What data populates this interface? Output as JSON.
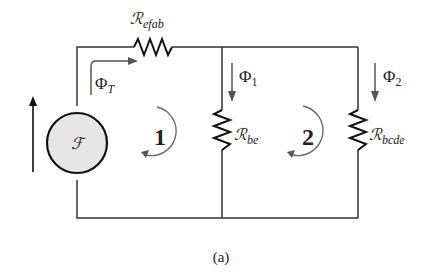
{
  "diagram": {
    "caption": "(a)",
    "source": {
      "symbol": "ℱ",
      "fill": "#e6e6e6"
    },
    "mmf_arrow_direction": "up",
    "resistors": [
      {
        "id": "efab",
        "symbol": "ℛ",
        "subscript": "efab",
        "position": "top"
      },
      {
        "id": "be",
        "symbol": "ℛ",
        "subscript": "be",
        "position": "middle-branch"
      },
      {
        "id": "bcde",
        "symbol": "ℛ",
        "subscript": "bcde",
        "position": "right-branch"
      }
    ],
    "fluxes": [
      {
        "id": "T",
        "symbol": "Φ",
        "subscript": "T",
        "direction": "right"
      },
      {
        "id": "1",
        "symbol": "Φ",
        "subscript": "1",
        "direction": "down"
      },
      {
        "id": "2",
        "symbol": "Φ",
        "subscript": "2",
        "direction": "down"
      }
    ],
    "loops": [
      {
        "number": "1",
        "direction": "clockwise-arc"
      },
      {
        "number": "2",
        "direction": "clockwise-arc"
      }
    ],
    "colors": {
      "wire": "#333333",
      "arrow": "#444444",
      "loop_arc": "#666666"
    }
  }
}
